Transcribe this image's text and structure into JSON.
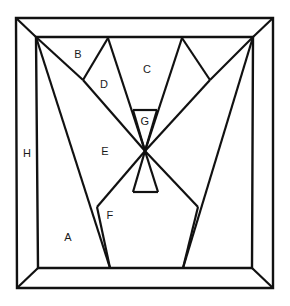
{
  "figure": {
    "background_color": "#ffffff",
    "line_color": "#111111",
    "label_color": "#1a1a1a",
    "outer_frame": {
      "outer": [
        [
          16,
          18
        ],
        [
          273,
          18
        ],
        [
          273,
          288
        ],
        [
          17,
          288
        ]
      ],
      "inner": [
        [
          36,
          37
        ],
        [
          253,
          37
        ],
        [
          252,
          268
        ],
        [
          38,
          268
        ]
      ],
      "stroke_width": 2.4
    },
    "center_point": [
      145,
      151
    ],
    "apex_top_left": [
      108,
      38
    ],
    "apex_top_right": [
      182,
      38
    ],
    "vertex_bottom_left": [
      110,
      268
    ],
    "vertex_bottom_right": [
      183,
      268
    ],
    "notch_upper_left": [
      83,
      80
    ],
    "notch_upper_right": [
      210,
      80
    ],
    "notch_lower_left": [
      97,
      207
    ],
    "notch_lower_right": [
      198,
      207
    ],
    "trapezoid_upper": {
      "y": 110,
      "x1": 133,
      "x2": 157
    },
    "trapezoid_lower": {
      "y": 192,
      "x1": 133,
      "x2": 158
    },
    "stroke_width_inner": 2.2
  },
  "labels": [
    {
      "id": "label-a",
      "text": "A",
      "x": 68,
      "y": 238
    },
    {
      "id": "label-b",
      "text": "B",
      "x": 78,
      "y": 55
    },
    {
      "id": "label-c",
      "text": "C",
      "x": 147,
      "y": 70
    },
    {
      "id": "label-d",
      "text": "D",
      "x": 104,
      "y": 85
    },
    {
      "id": "label-e",
      "text": "E",
      "x": 105,
      "y": 152
    },
    {
      "id": "label-f",
      "text": "F",
      "x": 110,
      "y": 216
    },
    {
      "id": "label-g",
      "text": "G",
      "x": 145,
      "y": 122
    },
    {
      "id": "label-h",
      "text": "H",
      "x": 27,
      "y": 154
    }
  ]
}
